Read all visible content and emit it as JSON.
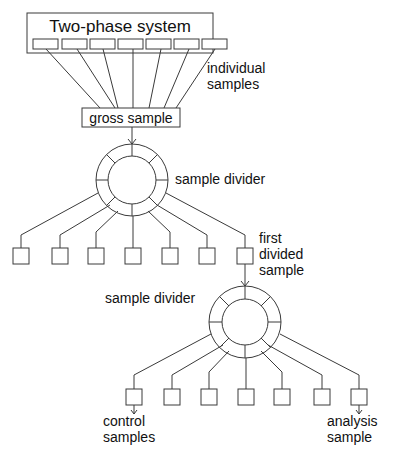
{
  "diagram": {
    "title": "Two-phase system",
    "gross_sample": "gross sample",
    "individual_samples": [
      "individual",
      "samples"
    ],
    "divider_1_label": "sample divider",
    "first_divided_sample": [
      "first",
      "divided",
      "sample"
    ],
    "divider_2_label": "sample divider",
    "control_samples": [
      "control",
      "samples"
    ],
    "analysis_sample": [
      "analysis",
      "sample"
    ],
    "stroke_color": "#3a3a3a",
    "text_color": "#111111"
  }
}
